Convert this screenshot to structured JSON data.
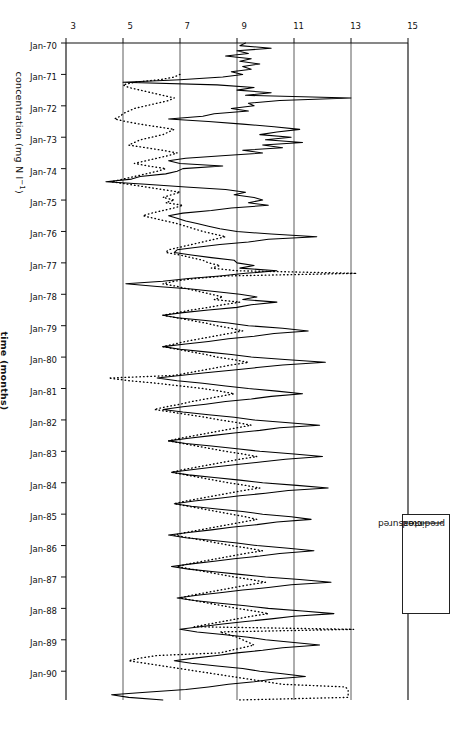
{
  "figure": {
    "orientation_note": "rotated",
    "background_color": "#ffffff",
    "ink_color": "#000000"
  },
  "legend": {
    "entries": [
      {
        "label": "predicted",
        "style": "solid"
      },
      {
        "label": "measured",
        "style": "dotted"
      }
    ]
  },
  "chart_data": {
    "type": "line",
    "title": "",
    "xlabel": "time (months)",
    "ylabel": "concentration (mg N l⁻¹)",
    "xtick_labels": [
      "Jan-70",
      "Jan-71",
      "Jan-72",
      "Jan-73",
      "Jan-74",
      "Jan-75",
      "Jan-76",
      "Jan-77",
      "Jan-78",
      "Jan-79",
      "Jan-80",
      "Jan-81",
      "Jan-82",
      "Jan-83",
      "Jan-84",
      "Jan-85",
      "Jan-86",
      "Jan-87",
      "Jan-88",
      "Jan-89",
      "Jan-90"
    ],
    "ytick_labels": [
      "3",
      "5",
      "7",
      "9",
      "11",
      "13",
      "15"
    ],
    "ytick_values": [
      3,
      5,
      7,
      9,
      11,
      13,
      15
    ],
    "ylim": [
      3,
      15
    ],
    "xlim": [
      0,
      252
    ],
    "x_unit": "months since Jan-1970",
    "grid": "vertical gridlines at y = 5, 7, 9, 11, 13",
    "legend_position": "top-right-outside",
    "series": [
      {
        "name": "predicted",
        "style": "solid",
        "values": [
          9.3,
          9.1,
          10.2,
          9.0,
          9.4,
          8.6,
          9.5,
          9.1,
          9.8,
          9.2,
          9.5,
          8.8,
          9.2,
          8.5,
          7.0,
          5.0,
          8.3,
          9.6,
          9.0,
          10.2,
          9.3,
          13.0,
          10.5,
          9.4,
          9.6,
          8.8,
          9.4,
          8.2,
          7.8,
          6.6,
          8.0,
          9.2,
          10.3,
          11.2,
          10.4,
          9.8,
          10.9,
          10.0,
          11.3,
          9.9,
          10.6,
          9.2,
          9.9,
          8.6,
          7.2,
          6.6,
          7.0,
          8.5,
          7.1,
          6.9,
          6.5,
          5.6,
          5.3,
          4.4,
          5.8,
          7.2,
          8.6,
          9.3,
          8.9,
          9.6,
          9.9,
          9.4,
          10.1,
          8.8,
          8.1,
          7.1,
          6.6,
          6.9,
          7.2,
          7.6,
          8.0,
          8.4,
          9.0,
          10.2,
          11.8,
          10.1,
          9.4,
          8.4,
          7.6,
          6.9,
          6.8,
          7.4,
          8.1,
          8.9,
          9.0,
          9.6,
          9.1,
          10.4,
          9.3,
          8.4,
          7.3,
          6.4,
          5.1,
          6.2,
          7.4,
          8.3,
          9.1,
          9.7,
          9.2,
          10.4,
          9.5,
          9.0,
          8.0,
          7.1,
          6.4,
          6.9,
          7.9,
          8.7,
          9.4,
          10.6,
          11.5,
          10.3,
          9.6,
          8.7,
          8.0,
          7.2,
          6.4,
          7.0,
          7.9,
          8.8,
          9.5,
          10.8,
          12.1,
          10.6,
          9.7,
          8.8,
          7.9,
          7.0,
          6.2,
          6.9,
          7.8,
          8.6,
          9.4,
          10.4,
          11.3,
          10.2,
          9.5,
          8.6,
          7.9,
          7.1,
          6.4,
          7.1,
          8.0,
          8.9,
          9.6,
          10.7,
          11.9,
          10.5,
          9.8,
          8.9,
          8.1,
          7.3,
          6.6,
          7.2,
          8.1,
          9.0,
          9.8,
          11.0,
          12.0,
          10.7,
          9.9,
          9.0,
          8.2,
          7.4,
          6.7,
          7.3,
          8.2,
          9.1,
          9.9,
          11.1,
          12.2,
          10.8,
          10.0,
          9.1,
          8.3,
          7.5,
          6.8,
          7.4,
          8.3,
          9.2,
          9.9,
          10.9,
          11.6,
          10.4,
          9.7,
          8.8,
          8.1,
          7.3,
          6.6,
          7.2,
          8.1,
          9.0,
          9.7,
          10.8,
          11.7,
          10.5,
          9.8,
          8.9,
          8.2,
          7.4,
          6.7,
          7.3,
          8.2,
          9.1,
          10.0,
          11.2,
          12.3,
          10.9,
          10.1,
          9.2,
          8.4,
          7.6,
          6.9,
          7.5,
          8.4,
          9.3,
          10.1,
          11.3,
          12.4,
          11.0,
          10.2,
          9.3,
          8.5,
          7.7,
          7.0,
          7.6,
          8.5,
          9.4,
          10.0,
          11.0,
          11.9,
          10.6,
          9.9,
          9.0,
          8.3,
          7.5,
          6.8,
          7.4,
          8.3,
          9.2,
          9.8,
          10.6,
          11.4,
          10.3,
          9.6,
          8.7,
          8.0,
          7.2,
          5.8,
          4.6,
          5.2,
          6.4
        ]
      },
      {
        "name": "measured",
        "style": "dotted",
        "values": [
          null,
          null,
          null,
          null,
          null,
          null,
          null,
          null,
          null,
          null,
          null,
          null,
          7.0,
          6.8,
          6.3,
          5.4,
          5.0,
          5.2,
          5.6,
          6.0,
          6.4,
          6.8,
          6.6,
          6.2,
          5.8,
          5.4,
          5.2,
          5.0,
          4.9,
          4.7,
          5.1,
          5.6,
          6.2,
          6.8,
          6.6,
          6.4,
          6.0,
          5.6,
          5.4,
          5.2,
          5.8,
          6.4,
          6.9,
          6.6,
          6.2,
          5.8,
          5.4,
          5.9,
          6.5,
          6.2,
          5.8,
          5.4,
          5.0,
          4.6,
          5.2,
          5.8,
          6.4,
          7.0,
          6.7,
          6.4,
          6.8,
          6.5,
          7.1,
          6.8,
          6.4,
          6.0,
          5.7,
          6.1,
          6.5,
          6.9,
          7.2,
          7.5,
          7.8,
          8.2,
          8.6,
          8.2,
          7.8,
          7.4,
          7.0,
          6.6,
          6.5,
          7.0,
          7.4,
          7.8,
          8.0,
          8.4,
          8.1,
          9.0,
          13.2,
          8.6,
          7.5,
          6.8,
          6.4,
          6.9,
          7.3,
          7.7,
          8.1,
          8.5,
          8.2,
          9.1,
          8.5,
          8.0,
          7.4,
          6.9,
          6.4,
          6.9,
          7.4,
          7.9,
          8.3,
          8.8,
          9.2,
          8.7,
          8.2,
          7.7,
          7.2,
          6.8,
          6.4,
          6.9,
          7.4,
          7.9,
          8.3,
          8.9,
          9.4,
          8.8,
          8.3,
          7.8,
          7.3,
          6.8,
          4.5,
          5.2,
          6.2,
          7.0,
          7.8,
          8.4,
          8.9,
          8.4,
          7.9,
          7.4,
          7.0,
          6.5,
          6.1,
          6.7,
          7.3,
          7.9,
          8.4,
          9.0,
          9.5,
          9.0,
          8.5,
          8.0,
          7.5,
          7.0,
          6.6,
          7.1,
          7.6,
          8.1,
          8.6,
          9.2,
          9.7,
          9.1,
          8.6,
          8.1,
          7.6,
          7.1,
          6.7,
          7.2,
          7.7,
          8.2,
          8.7,
          9.3,
          9.8,
          9.2,
          8.7,
          8.2,
          7.7,
          7.2,
          6.8,
          7.3,
          7.8,
          8.3,
          8.8,
          9.3,
          9.7,
          9.2,
          8.7,
          8.2,
          7.7,
          7.2,
          6.8,
          7.3,
          7.8,
          8.3,
          8.8,
          9.4,
          9.9,
          9.3,
          8.8,
          8.3,
          7.8,
          7.3,
          6.9,
          7.4,
          7.9,
          8.4,
          8.9,
          9.5,
          10.0,
          9.4,
          8.9,
          8.4,
          7.9,
          7.4,
          7.0,
          7.5,
          8.0,
          8.5,
          9.0,
          9.6,
          10.1,
          9.5,
          9.0,
          8.5,
          8.0,
          7.5,
          13.1,
          8.4,
          8.7,
          9.0,
          9.2,
          9.4,
          9.6,
          9.2,
          8.8,
          8.4,
          6.2,
          5.6,
          5.2,
          5.8,
          6.4,
          7.0,
          7.6,
          8.2,
          8.8,
          9.4,
          10.0,
          10.6,
          12.8,
          12.9,
          12.9,
          12.9,
          12.9,
          9.0
        ]
      }
    ]
  }
}
